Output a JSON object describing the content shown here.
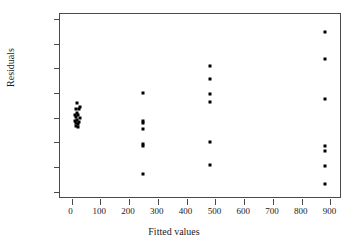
{
  "chart_data": {
    "type": "scatter",
    "title": "",
    "xlabel": "Fitted values",
    "ylabel": "Residuals",
    "xlim": [
      -40,
      940
    ],
    "ylim": [
      -33,
      42
    ],
    "xticks": [
      0,
      100,
      200,
      300,
      400,
      500,
      600,
      700,
      800,
      900
    ],
    "xticklabels": [
      "0",
      "100",
      "200",
      "300",
      "400",
      "500",
      "600",
      "700",
      "800",
      "900"
    ],
    "yticks": [
      -30,
      -20,
      -10,
      0,
      10,
      20,
      30,
      40
    ],
    "yticklabels": [
      "-30",
      "-20",
      "-10",
      "0",
      "10",
      "20",
      "30",
      "40"
    ],
    "grid": false,
    "legend": null,
    "marker": "square",
    "marker_color": "#000000",
    "points": [
      {
        "x": 18,
        "y": 6.1
      },
      {
        "x": 30,
        "y": 4.2
      },
      {
        "x": 14,
        "y": 3.6
      },
      {
        "x": 26,
        "y": 3.4
      },
      {
        "x": 20,
        "y": 2.0
      },
      {
        "x": 12,
        "y": 1.2
      },
      {
        "x": 24,
        "y": 0.9
      },
      {
        "x": 16,
        "y": 0.2
      },
      {
        "x": 28,
        "y": -0.3
      },
      {
        "x": 19,
        "y": -0.8
      },
      {
        "x": 13,
        "y": -1.4
      },
      {
        "x": 25,
        "y": -1.6
      },
      {
        "x": 17,
        "y": -2.1
      },
      {
        "x": 21,
        "y": -2.6
      },
      {
        "x": 15,
        "y": -3.3
      },
      {
        "x": 23,
        "y": -3.7
      },
      {
        "x": 250,
        "y": 9.8
      },
      {
        "x": 250,
        "y": -1.5
      },
      {
        "x": 250,
        "y": -2.2
      },
      {
        "x": 250,
        "y": -4.5
      },
      {
        "x": 250,
        "y": -10.6
      },
      {
        "x": 250,
        "y": -11.4
      },
      {
        "x": 250,
        "y": -22.7
      },
      {
        "x": 482,
        "y": 21.1
      },
      {
        "x": 482,
        "y": 15.8
      },
      {
        "x": 482,
        "y": 9.4
      },
      {
        "x": 482,
        "y": 6.2
      },
      {
        "x": 482,
        "y": -9.7
      },
      {
        "x": 482,
        "y": -19.2
      },
      {
        "x": 882,
        "y": 34.6
      },
      {
        "x": 882,
        "y": 23.7
      },
      {
        "x": 882,
        "y": 7.4
      },
      {
        "x": 882,
        "y": -11.4
      },
      {
        "x": 882,
        "y": -13.5
      },
      {
        "x": 882,
        "y": -19.7
      },
      {
        "x": 882,
        "y": -27.1
      }
    ]
  }
}
